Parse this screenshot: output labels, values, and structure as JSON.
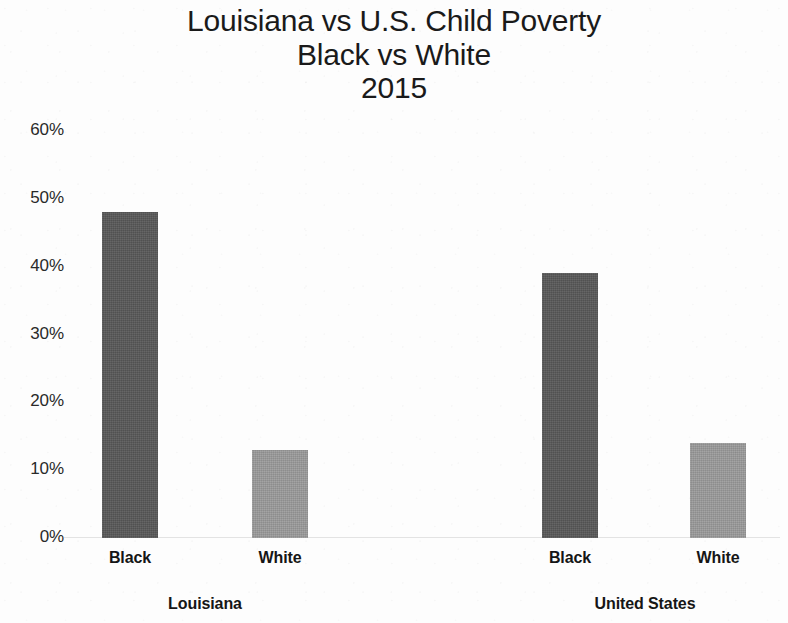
{
  "chart_data": {
    "type": "bar",
    "title": "Louisiana vs U.S. Child Poverty Black vs White 2015",
    "title_lines": [
      "Louisiana vs U.S. Child Poverty",
      "Black vs White",
      "2015"
    ],
    "xlabel": "",
    "ylabel": "",
    "ylim": [
      0,
      60
    ],
    "y_tick_labels": [
      "0%",
      "10%",
      "20%",
      "30%",
      "40%",
      "50%",
      "60%"
    ],
    "y_tick_values": [
      0,
      10,
      20,
      30,
      40,
      50,
      60
    ],
    "grid": false,
    "legend": "none",
    "units": "percent",
    "groups": [
      {
        "name": "Louisiana",
        "categories": [
          "Black",
          "White"
        ],
        "values": [
          48,
          13
        ]
      },
      {
        "name": "United States",
        "categories": [
          "Black",
          "White"
        ],
        "values": [
          39,
          14
        ]
      }
    ],
    "categories": [
      "Black",
      "White"
    ],
    "series": [
      {
        "name": "Louisiana",
        "values": [
          48,
          13
        ]
      },
      {
        "name": "United States",
        "values": [
          39,
          14
        ]
      }
    ],
    "bars": [
      {
        "group": "Louisiana",
        "category": "Black",
        "value": 48,
        "color": "#585858"
      },
      {
        "group": "Louisiana",
        "category": "White",
        "value": 13,
        "color": "#9b9b9b"
      },
      {
        "group": "United States",
        "category": "Black",
        "value": 39,
        "color": "#585858"
      },
      {
        "group": "United States",
        "category": "White",
        "value": 14,
        "color": "#9b9b9b"
      }
    ],
    "colors": {
      "black_bar": "#585858",
      "white_bar": "#9b9b9b",
      "background": "#fdfdfd",
      "text": "#1a1a1a"
    }
  },
  "axis": {
    "ticks": [
      {
        "label": "60%",
        "value": 60
      },
      {
        "label": "50%",
        "value": 50
      },
      {
        "label": "40%",
        "value": 40
      },
      {
        "label": "30%",
        "value": 30
      },
      {
        "label": "20%",
        "value": 20
      },
      {
        "label": "10%",
        "value": 10
      },
      {
        "label": "0%",
        "value": 0
      }
    ]
  },
  "labels": {
    "cat_la_black": "Black",
    "cat_la_white": "White",
    "cat_us_black": "Black",
    "cat_us_white": "White",
    "group_la": "Louisiana",
    "group_us": "United States"
  }
}
